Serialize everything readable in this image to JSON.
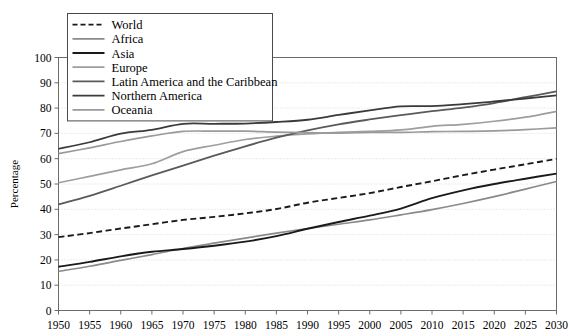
{
  "chart_data": {
    "type": "line",
    "title": "",
    "subtitle": "",
    "xlabel": "",
    "ylabel": "Percentage",
    "xlim": [
      1950,
      2030
    ],
    "ylim": [
      0,
      100
    ],
    "grid": true,
    "legend_position": "top-left",
    "x": [
      1950,
      1955,
      1960,
      1965,
      1970,
      1975,
      1980,
      1985,
      1990,
      1995,
      2000,
      2005,
      2010,
      2015,
      2020,
      2025,
      2030
    ],
    "x_ticklabels": [
      "1950",
      "1955",
      "1960",
      "1965",
      "1970",
      "1975",
      "1980",
      "1985",
      "1990",
      "1995",
      "2000",
      "2005",
      "2010",
      "2015",
      "2020",
      "2025",
      "2030"
    ],
    "y_ticks": [
      0,
      10,
      20,
      30,
      40,
      50,
      60,
      70,
      80,
      90,
      100
    ],
    "y_ticklabels": [
      "0",
      "10",
      "20",
      "30",
      "40",
      "50",
      "60",
      "70",
      "80",
      "90",
      "100"
    ],
    "series": [
      {
        "name": "World",
        "color": "#1a1a1a",
        "style": "dashed",
        "width": 1.9,
        "values": [
          29.0,
          30.6,
          32.4,
          34.1,
          35.8,
          37.0,
          38.4,
          40.1,
          42.6,
          44.5,
          46.4,
          48.8,
          51.1,
          53.5,
          55.7,
          57.8,
          59.9
        ]
      },
      {
        "name": "Africa",
        "color": "#8a8a8a",
        "style": "solid",
        "width": 1.7,
        "values": [
          15.5,
          17.5,
          19.8,
          22.1,
          24.5,
          26.6,
          28.6,
          30.6,
          32.4,
          34.1,
          35.8,
          37.8,
          39.9,
          42.3,
          45.0,
          48.0,
          51.0
        ]
      },
      {
        "name": "Asia",
        "color": "#1a1a1a",
        "style": "solid",
        "width": 1.9,
        "values": [
          17.3,
          19.2,
          21.4,
          23.2,
          24.3,
          25.6,
          27.2,
          29.4,
          32.3,
          35.0,
          37.5,
          40.3,
          44.4,
          47.5,
          50.0,
          52.1,
          54.1
        ]
      },
      {
        "name": "Europe",
        "color": "#9e9e9e",
        "style": "solid",
        "width": 1.7,
        "values": [
          50.5,
          53.0,
          55.6,
          58.0,
          62.8,
          65.3,
          67.6,
          68.9,
          69.8,
          70.4,
          70.8,
          71.4,
          72.8,
          73.6,
          74.8,
          76.4,
          78.7
        ]
      },
      {
        "name": "Latin America and the Caribbean",
        "color": "#5a5a5a",
        "style": "solid",
        "width": 1.8,
        "values": [
          41.9,
          45.3,
          49.3,
          53.4,
          57.3,
          61.2,
          64.9,
          68.3,
          71.2,
          73.6,
          75.5,
          77.2,
          78.8,
          80.2,
          82.0,
          84.3,
          86.6
        ]
      },
      {
        "name": "Northern America",
        "color": "#3a3a3a",
        "style": "solid",
        "width": 1.8,
        "values": [
          63.9,
          66.5,
          69.9,
          71.4,
          73.8,
          73.8,
          73.9,
          74.5,
          75.4,
          77.3,
          79.1,
          80.7,
          80.8,
          81.6,
          82.6,
          83.8,
          85.0
        ]
      },
      {
        "name": "Oceania",
        "color": "#9a9a9a",
        "style": "solid",
        "width": 1.7,
        "values": [
          62.0,
          64.3,
          66.8,
          69.0,
          70.8,
          70.9,
          70.9,
          70.5,
          70.3,
          70.1,
          70.4,
          70.4,
          70.7,
          70.8,
          71.0,
          71.5,
          72.2
        ]
      }
    ],
    "legend_entries": [
      {
        "label": "World",
        "color": "#1a1a1a",
        "style": "dashed"
      },
      {
        "label": "Africa",
        "color": "#8a8a8a",
        "style": "solid"
      },
      {
        "label": "Asia",
        "color": "#1a1a1a",
        "style": "solid"
      },
      {
        "label": "Europe",
        "color": "#9e9e9e",
        "style": "solid"
      },
      {
        "label": "Latin America and the Caribbean",
        "color": "#5a5a5a",
        "style": "solid"
      },
      {
        "label": "Northern America",
        "color": "#3a3a3a",
        "style": "solid"
      },
      {
        "label": "Oceania",
        "color": "#9a9a9a",
        "style": "solid"
      }
    ]
  }
}
